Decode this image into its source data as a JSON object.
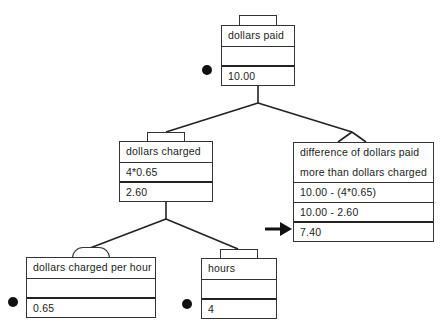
{
  "diagram": {
    "nodes": {
      "dollars_paid": {
        "label": "dollars paid",
        "expression": "",
        "value": "10.00",
        "given": true
      },
      "dollars_charged": {
        "label": "dollars charged",
        "expression": "4*0.65",
        "value": "2.60",
        "given": false
      },
      "difference": {
        "label_line1": "difference of dollars paid",
        "label_line2": "more than dollars charged",
        "expression1": "10.00  -  (4*0.65)",
        "expression2": "10.00  -  2.60",
        "value": "7.40",
        "target": true
      },
      "dollars_charged_per_hour": {
        "label": "dollars charged per hour",
        "expression": "",
        "value": "0.65",
        "given": true
      },
      "hours": {
        "label": "hours",
        "expression": "",
        "value": "4",
        "given": true
      }
    },
    "edges": [
      {
        "from": "dollars_paid",
        "to": "dollars_charged"
      },
      {
        "from": "dollars_paid",
        "to": "difference"
      },
      {
        "from": "dollars_charged",
        "to": "dollars_charged_per_hour"
      },
      {
        "from": "dollars_charged",
        "to": "hours"
      }
    ],
    "colors": {
      "line": "#222222",
      "background": "#ffffff",
      "marker": "#111111"
    }
  }
}
